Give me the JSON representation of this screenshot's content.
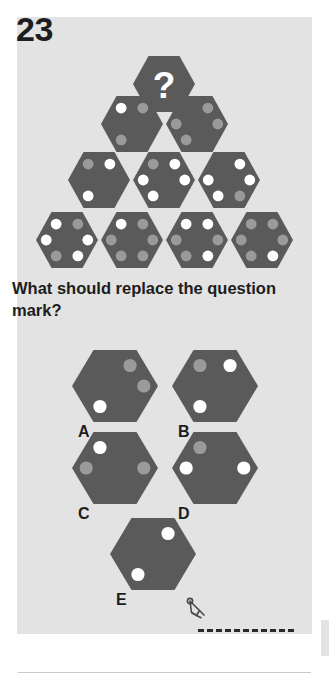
{
  "page": {
    "question_number": "23",
    "prompt": "What should replace the question mark?",
    "background_color": "#e3e3e3",
    "hex_fill": "#5a5a5a",
    "dot_white": "#ffffff",
    "dot_gray": "#9a9a9a",
    "question_mark": "?"
  },
  "pyramid": {
    "description": "Hexagon pyramid with a question mark hexagon at the apex",
    "rows": [
      {
        "row": 1,
        "cells": [
          {
            "id": "apex",
            "type": "question",
            "label": "?",
            "dots": []
          }
        ]
      },
      {
        "row": 2,
        "cells": [
          {
            "id": "r2c1",
            "type": "hex",
            "dots": [
              {
                "pos": "top-left",
                "color": "white"
              },
              {
                "pos": "top-right",
                "color": "gray"
              },
              {
                "pos": "bottom-left",
                "color": "gray"
              }
            ]
          },
          {
            "id": "r2c2",
            "type": "hex",
            "dots": [
              {
                "pos": "top-right",
                "color": "gray"
              },
              {
                "pos": "left",
                "color": "gray"
              },
              {
                "pos": "right",
                "color": "gray"
              },
              {
                "pos": "bottom-left",
                "color": "gray"
              }
            ]
          }
        ]
      },
      {
        "row": 3,
        "cells": [
          {
            "id": "r3c1",
            "type": "hex",
            "dots": [
              {
                "pos": "top-left",
                "color": "gray"
              },
              {
                "pos": "top-right",
                "color": "white"
              },
              {
                "pos": "bottom-left",
                "color": "white"
              }
            ]
          },
          {
            "id": "r3c2",
            "type": "hex",
            "dots": [
              {
                "pos": "top-left",
                "color": "gray"
              },
              {
                "pos": "top-right",
                "color": "white"
              },
              {
                "pos": "left",
                "color": "white"
              },
              {
                "pos": "right",
                "color": "white"
              },
              {
                "pos": "bottom-left",
                "color": "white"
              }
            ]
          },
          {
            "id": "r3c3",
            "type": "hex",
            "dots": [
              {
                "pos": "top-right",
                "color": "white"
              },
              {
                "pos": "left",
                "color": "white"
              },
              {
                "pos": "right",
                "color": "white"
              },
              {
                "pos": "bottom-left",
                "color": "white"
              },
              {
                "pos": "bottom-right",
                "color": "gray"
              }
            ]
          }
        ]
      },
      {
        "row": 4,
        "cells": [
          {
            "id": "r4c1",
            "type": "hex",
            "dots": [
              {
                "pos": "top-left",
                "color": "white"
              },
              {
                "pos": "top-right",
                "color": "gray"
              },
              {
                "pos": "left",
                "color": "white"
              },
              {
                "pos": "right",
                "color": "white"
              },
              {
                "pos": "bottom-left",
                "color": "gray"
              },
              {
                "pos": "bottom-right",
                "color": "white"
              }
            ]
          },
          {
            "id": "r4c2",
            "type": "hex",
            "dots": [
              {
                "pos": "top-left",
                "color": "white"
              },
              {
                "pos": "top-right",
                "color": "gray"
              },
              {
                "pos": "left",
                "color": "gray"
              },
              {
                "pos": "right",
                "color": "gray"
              },
              {
                "pos": "bottom-left",
                "color": "gray"
              },
              {
                "pos": "bottom-right",
                "color": "gray"
              }
            ]
          },
          {
            "id": "r4c3",
            "type": "hex",
            "dots": [
              {
                "pos": "top-left",
                "color": "white"
              },
              {
                "pos": "top-right",
                "color": "white"
              },
              {
                "pos": "left",
                "color": "gray"
              },
              {
                "pos": "right",
                "color": "gray"
              },
              {
                "pos": "bottom-left",
                "color": "gray"
              },
              {
                "pos": "bottom-right",
                "color": "white"
              }
            ]
          },
          {
            "id": "r4c4",
            "type": "hex",
            "dots": [
              {
                "pos": "top-left",
                "color": "gray"
              },
              {
                "pos": "top-right",
                "color": "gray"
              },
              {
                "pos": "left",
                "color": "gray"
              },
              {
                "pos": "right",
                "color": "gray"
              },
              {
                "pos": "bottom-left",
                "color": "gray"
              },
              {
                "pos": "bottom-right",
                "color": "white"
              }
            ]
          }
        ]
      }
    ]
  },
  "options": [
    {
      "label": "A",
      "dots": [
        {
          "pos": "top-right",
          "color": "gray"
        },
        {
          "pos": "right",
          "color": "gray"
        },
        {
          "pos": "bottom-left",
          "color": "white"
        }
      ]
    },
    {
      "label": "B",
      "dots": [
        {
          "pos": "top-left",
          "color": "gray"
        },
        {
          "pos": "top-right",
          "color": "white"
        },
        {
          "pos": "bottom-left",
          "color": "white"
        }
      ]
    },
    {
      "label": "C",
      "dots": [
        {
          "pos": "top-left",
          "color": "white"
        },
        {
          "pos": "left",
          "color": "gray"
        },
        {
          "pos": "right",
          "color": "gray"
        }
      ]
    },
    {
      "label": "D",
      "dots": [
        {
          "pos": "top-left",
          "color": "gray"
        },
        {
          "pos": "left",
          "color": "white"
        },
        {
          "pos": "right",
          "color": "white"
        }
      ]
    },
    {
      "label": "E",
      "dots": [
        {
          "pos": "top-right",
          "color": "white"
        },
        {
          "pos": "bottom-left",
          "color": "white"
        }
      ]
    }
  ],
  "answer_area": {
    "icon": "pencil-icon",
    "line_style": "dashed",
    "value": ""
  }
}
